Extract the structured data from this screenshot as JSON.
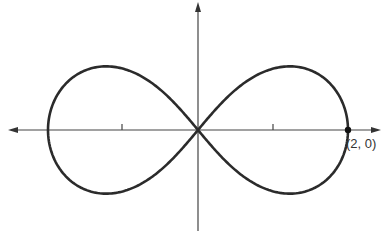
{
  "figure": {
    "type": "lemniscate",
    "equation": "r^2 = 4cos(2θ)",
    "a": 2,
    "point_label": "(2, 0)",
    "ticks_x": [
      -1,
      1
    ],
    "colors": {
      "curve": "#2b2b2b",
      "axis": "#444444"
    }
  }
}
